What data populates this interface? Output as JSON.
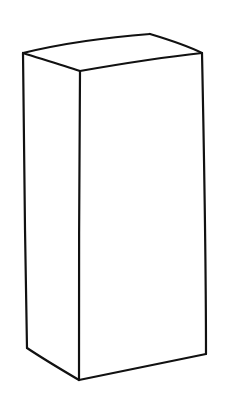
{
  "image": {
    "subject": "Hand-drawn line sketch of a tall rectangular box (cuboid)",
    "background_color": "#ffffff",
    "stroke_color": "#111111"
  },
  "box": {
    "vertices": {
      "top_left": [
        23,
        53
      ],
      "top_front": [
        80,
        71
      ],
      "top_back": [
        150,
        34
      ],
      "top_right": [
        202,
        53
      ],
      "bottom_left": [
        27,
        348
      ],
      "bottom_front": [
        79,
        380
      ],
      "bottom_right": [
        206,
        354
      ]
    }
  }
}
